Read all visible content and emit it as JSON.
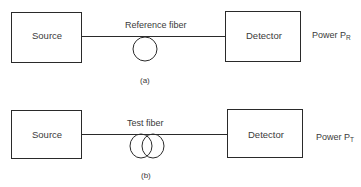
{
  "diagrams": [
    {
      "id": "a",
      "caption": "(a)",
      "source_label": "Source",
      "fiber_label": "Reference fiber",
      "detector_label": "Detector",
      "power_label": "Power P",
      "power_subscript": "R",
      "fiber_loops": 1
    },
    {
      "id": "b",
      "caption": "(b)",
      "source_label": "Source",
      "fiber_label": "Test fiber",
      "detector_label": "Detector",
      "power_label": "Power P",
      "power_subscript": "T",
      "fiber_loops": 2
    }
  ],
  "colors": {
    "stroke": "#2a2a2a",
    "text": "#3a3a3a",
    "background": "#ffffff"
  }
}
